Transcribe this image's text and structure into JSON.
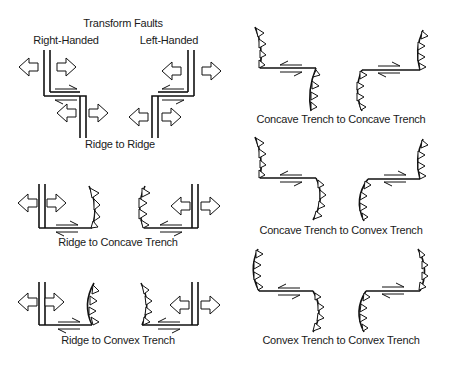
{
  "title": "Transform Faults",
  "left_column": {
    "headers": {
      "right_handed": "Right-Handed",
      "left_handed": "Left-Handed"
    },
    "panels": [
      {
        "id": "ridge-ridge",
        "caption": "Ridge to Ridge"
      },
      {
        "id": "ridge-concave",
        "caption": "Ridge to Concave Trench"
      },
      {
        "id": "ridge-convex",
        "caption": "Ridge to Convex Trench"
      }
    ]
  },
  "right_column": {
    "panels": [
      {
        "id": "concave-concave",
        "caption": "Concave Trench to Concave Trench"
      },
      {
        "id": "concave-convex",
        "caption": "Concave Trench to Convex Trench"
      },
      {
        "id": "convex-convex",
        "caption": "Convex Trench to Convex Trench"
      }
    ]
  },
  "colors": {
    "ink": "#111111",
    "background": "#ffffff"
  }
}
